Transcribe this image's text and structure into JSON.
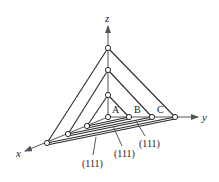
{
  "diagram": {
    "axes": {
      "x": "x",
      "y": "y",
      "z": "z"
    },
    "point_labels": [
      "A",
      "B",
      "C"
    ],
    "plane_labels": [
      "(111)",
      "(111)",
      "(111)"
    ],
    "colors": {
      "line": "#2b2b2b",
      "axis": "#555555",
      "background": "#ffffff"
    }
  }
}
